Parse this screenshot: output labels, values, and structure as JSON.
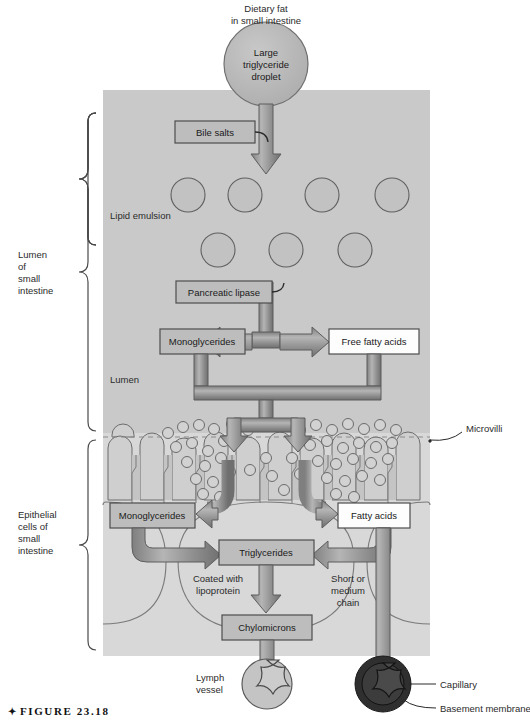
{
  "figure": {
    "caption_marker": "✦",
    "caption_text": "FIGURE 23.18"
  },
  "top_labels": {
    "dietary_fat_line1": "Dietary fat",
    "dietary_fat_line2": "in small intestine"
  },
  "droplet": {
    "line1": "Large",
    "line2": "triglyceride",
    "line3": "droplet"
  },
  "side_labels": {
    "lumen_brace": {
      "line1": "Lumen",
      "line2": "of",
      "line3": "small",
      "line4": "intestine"
    },
    "epithelial_brace": {
      "line1": "Epithelial",
      "line2": "cells of",
      "line3": "small",
      "line4": "intestine"
    }
  },
  "inline_labels": {
    "lipid_emulsion": "Lipid emulsion",
    "lumen": "Lumen",
    "microvilli": "Microvilli",
    "coated_with_line1": "Coated with",
    "coated_with_line2": "lipoprotein",
    "short_chain_line1": "Short or",
    "short_chain_line2": "medium",
    "short_chain_line3": "chain",
    "lymph_vessel_line1": "Lymph",
    "lymph_vessel_line2": "vessel",
    "capillary": "Capillary",
    "basement_membrane": "Basement membrane"
  },
  "boxes": {
    "bile_salts": "Bile salts",
    "pancreatic_lipase": "Pancreatic lipase",
    "monoglycerides_lumen": "Monoglycerides",
    "free_fatty_acids": "Free fatty acids",
    "monoglycerides_cell": "Monoglycerides",
    "fatty_acids": "Fatty acids",
    "triglycerides": "Triglycerides",
    "chylomicrons": "Chylomicrons"
  },
  "colors": {
    "page_background": "#ffffff",
    "panel_lumen": "#c9c9c9",
    "panel_cell": "#d6d6d6",
    "box_fill_gray": "#bdbdbd",
    "box_fill_white": "#fdfdfd",
    "box_stroke": "#555555",
    "arrow_fill": "#9b9b9b",
    "arrow_stroke": "#5d5d5d",
    "droplet_fill": "#b9b9b9",
    "vesicle_fill": "#cfcfcf",
    "capillary_dark": "#2f2f2f",
    "lymph_fill": "#c4c4c4",
    "text": "#2b2b2b",
    "line": "#6a6a6a"
  }
}
